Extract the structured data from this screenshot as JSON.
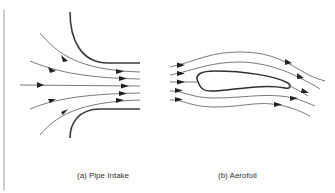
{
  "figure": {
    "panels": [
      {
        "id": "a",
        "caption": "(a) Pipe Intake",
        "elements": [
          "upper pipe wall",
          "lower pipe wall",
          "5 converging streamlines with arrows"
        ]
      },
      {
        "id": "b",
        "caption": "(b) Aerofoil",
        "elements": [
          "aerofoil profile",
          "5 streamlines flowing around aerofoil with arrows"
        ]
      }
    ],
    "colors": {
      "wall": "#3a3a3a",
      "streamline": "#6a6a6a",
      "arrow": "#222222",
      "caption": "#333333",
      "background": "#ffffff"
    }
  }
}
